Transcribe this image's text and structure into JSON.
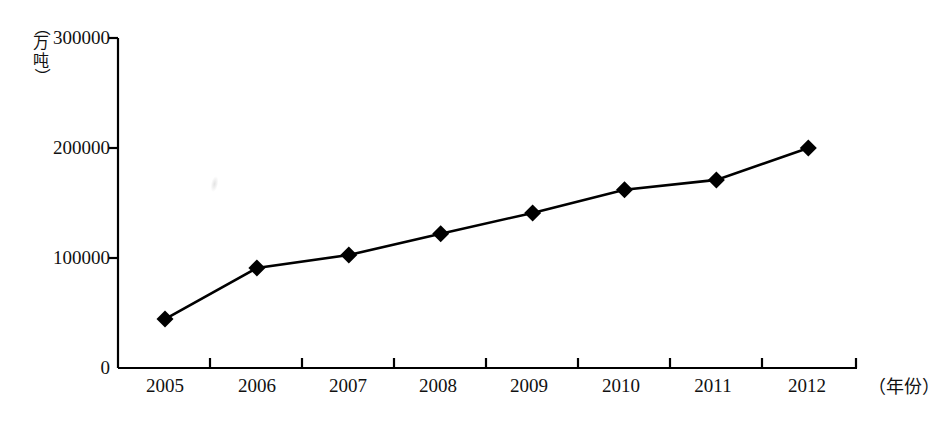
{
  "chart_data": {
    "type": "line",
    "title": "",
    "subtitle": "",
    "xlabel": "（年份）",
    "ylabel": "（万吨）",
    "categories": [
      "2005",
      "2006",
      "2007",
      "2008",
      "2009",
      "2010",
      "2011",
      "2012"
    ],
    "values": [
      44500,
      91000,
      102700,
      122000,
      141000,
      162000,
      171000,
      200000
    ],
    "series": [
      {
        "name": "",
        "values": [
          44500,
          91000,
          102700,
          122000,
          141000,
          162000,
          171000,
          200000
        ]
      }
    ],
    "ylim": [
      0,
      300000
    ],
    "yticks": [
      "0",
      "100000",
      "200000",
      "300000"
    ],
    "ytick_values": [
      0,
      100000,
      200000,
      300000
    ],
    "xticks": [
      "2005",
      "2006",
      "2007",
      "2008",
      "2009",
      "2010",
      "2011",
      "2012"
    ],
    "grid": false,
    "legend": false,
    "legend_position": "none",
    "marker": "diamond",
    "line_color": "#000000",
    "marker_color": "#000000",
    "axis_color": "#000000",
    "background_color": "#ffffff"
  },
  "axes": {
    "y_unit_paren_open": "（",
    "y_unit_char_1": "万",
    "y_unit_char_2": "吨",
    "y_unit_paren_close": "）",
    "y_tick_0": "0",
    "y_tick_1": "100000",
    "y_tick_2": "200000",
    "y_tick_3": "300000",
    "x_axis_caption": "（年份）"
  },
  "x_labels": {
    "l0": "2005",
    "l1": "2006",
    "l2": "2007",
    "l3": "2008",
    "l4": "2009",
    "l5": "2010",
    "l6": "2011",
    "l7": "2012"
  }
}
